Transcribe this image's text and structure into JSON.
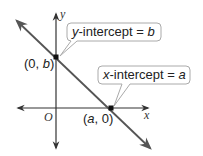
{
  "diagram": {
    "axes": {
      "x_label": "x",
      "y_label": "y",
      "origin_label": "O"
    },
    "points": {
      "y_intercept": {
        "label_open": "(0, ",
        "var": "b",
        "label_close": ")"
      },
      "x_intercept": {
        "label_open": "(",
        "var": "a",
        "label_close": ", 0)"
      }
    },
    "callouts": {
      "y_intercept": {
        "var": "y",
        "text": "-intercept = ",
        "value": "b"
      },
      "x_intercept": {
        "var": "x",
        "text": "-intercept = ",
        "value": "a"
      }
    },
    "colors": {
      "line": "#555555",
      "axis": "#333333",
      "callout_border": "#aaaaaa",
      "point": "#111111"
    }
  }
}
